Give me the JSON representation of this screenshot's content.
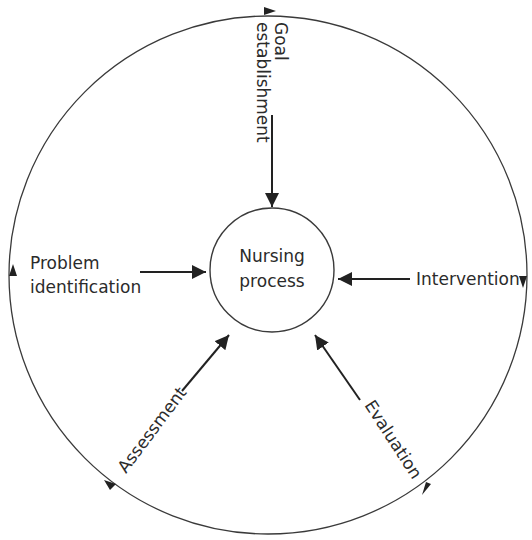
{
  "diagram": {
    "type": "cycle",
    "center": {
      "line1": "Nursing",
      "line2": "process"
    },
    "stages": [
      {
        "id": "goal",
        "line1": "Goal",
        "line2": "establishment",
        "arrow": "toward-center"
      },
      {
        "id": "intervention",
        "line1": "Intervention",
        "arrow": "toward-center"
      },
      {
        "id": "evaluation",
        "line1": "Evaluation",
        "arrow": "toward-center"
      },
      {
        "id": "assessment",
        "line1": "Assessment",
        "arrow": "toward-center"
      },
      {
        "id": "problem",
        "line1": "Problem",
        "line2": "identification",
        "arrow": "toward-center"
      }
    ],
    "outer_cycle_direction": "clockwise",
    "colors": {
      "ink": "#2b2b2b",
      "background": "#ffffff"
    }
  }
}
